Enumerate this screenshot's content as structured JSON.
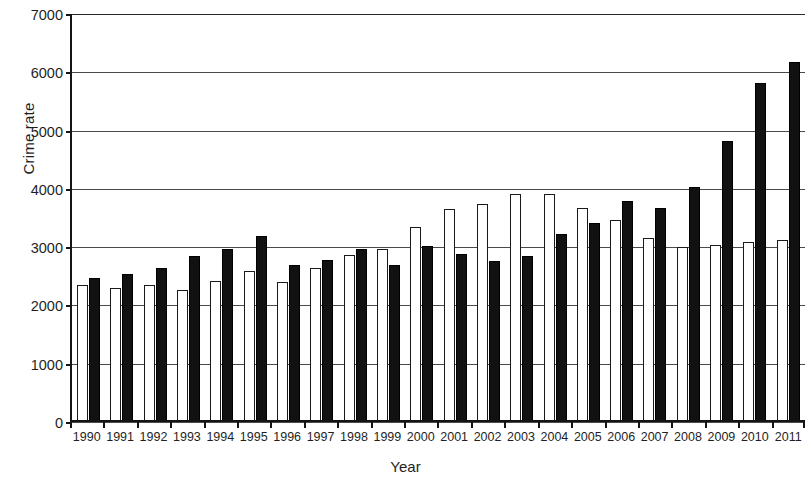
{
  "chart_data": {
    "type": "bar",
    "title": "",
    "xlabel": "Year",
    "ylabel": "Crime rate",
    "ylim": [
      0,
      7000
    ],
    "yticks": [
      0,
      1000,
      2000,
      3000,
      4000,
      5000,
      6000,
      7000
    ],
    "grid": true,
    "legend": "none",
    "categories": [
      "1990",
      "1991",
      "1992",
      "1993",
      "1994",
      "1995",
      "1996",
      "1997",
      "1998",
      "1999",
      "2000",
      "2001",
      "2002",
      "2003",
      "2004",
      "2005",
      "2006",
      "2007",
      "2008",
      "2009",
      "2010",
      "2011"
    ],
    "series": [
      {
        "name": "open-bar",
        "style": "white-outlined",
        "color": "#ffffff",
        "values": [
          2320,
          2270,
          2320,
          2230,
          2390,
          2550,
          2360,
          2600,
          2830,
          2940,
          3310,
          3620,
          3700,
          3870,
          3870,
          3640,
          3430,
          3120,
          2970,
          3000,
          3050,
          3090
        ]
      },
      {
        "name": "filled-bar",
        "style": "black-filled",
        "color": "#111111",
        "values": [
          2440,
          2510,
          2600,
          2810,
          2930,
          3150,
          2660,
          2740,
          2940,
          2660,
          2980,
          2840,
          2720,
          2820,
          3190,
          3380,
          3750,
          3630,
          4000,
          4780,
          5790,
          6150
        ]
      }
    ]
  },
  "axis": {
    "y_tick_labels": [
      "7000",
      "6000",
      "5000",
      "4000",
      "3000",
      "2000",
      "1000",
      "0"
    ],
    "y_title": "Crime rate",
    "x_title": "Year"
  },
  "colors": {
    "axis": "#141414",
    "grid": "#4a4a4a",
    "bar_open": "#ffffff",
    "bar_filled": "#111111",
    "background": "#ffffff"
  }
}
